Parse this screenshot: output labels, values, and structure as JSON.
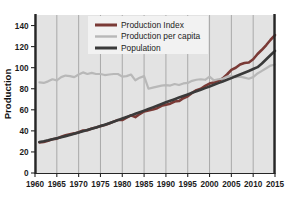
{
  "chart_data": {
    "type": "line",
    "title": "",
    "xlabel": "",
    "ylabel": "Production",
    "xlim": [
      1960,
      2015
    ],
    "ylim": [
      0,
      150
    ],
    "grid": "vertical",
    "legend_position": "top-center",
    "xticks": [
      "1960",
      "1965",
      "1970",
      "1975",
      "1980",
      "1985",
      "1990",
      "1995",
      "2000",
      "2005",
      "2010",
      "2015"
    ],
    "yticks": [
      "0",
      "20",
      "40",
      "60",
      "80",
      "100",
      "120",
      "140"
    ],
    "x": [
      1961,
      1962,
      1963,
      1964,
      1965,
      1966,
      1967,
      1968,
      1969,
      1970,
      1971,
      1972,
      1973,
      1974,
      1975,
      1976,
      1977,
      1978,
      1979,
      1980,
      1981,
      1982,
      1983,
      1984,
      1985,
      1986,
      1987,
      1988,
      1989,
      1990,
      1991,
      1992,
      1993,
      1994,
      1995,
      1996,
      1997,
      1998,
      1999,
      2000,
      2001,
      2002,
      2003,
      2004,
      2005,
      2006,
      2007,
      2008,
      2009,
      2010,
      2011,
      2012,
      2013,
      2014,
      2015
    ],
    "series": [
      {
        "name": "Production Index",
        "color": "#7a3a36",
        "values": [
          29.0,
          29.5,
          30.6,
          32.0,
          32.6,
          34.4,
          35.8,
          36.8,
          37.6,
          38.7,
          40.4,
          40.6,
          42.3,
          43.2,
          44.5,
          45.5,
          47.0,
          48.8,
          50.3,
          50.3,
          52.5,
          54.8,
          53.1,
          56.0,
          58.4,
          59.4,
          60.2,
          61.5,
          63.8,
          64.7,
          65.8,
          67.9,
          68.3,
          71.0,
          72.9,
          76.0,
          78.6,
          80.0,
          82.7,
          84.9,
          86.0,
          87.6,
          89.7,
          93.5,
          97.9,
          99.9,
          103.0,
          104.4,
          104.9,
          108.0,
          113.0,
          117.0,
          121.5,
          126.5,
          131.0
        ]
      },
      {
        "name": "Production per capita",
        "color": "#b8b8b8",
        "values": [
          86.0,
          85.5,
          87.0,
          89.0,
          88.0,
          91.0,
          92.5,
          92.0,
          91.0,
          93.5,
          95.5,
          94.0,
          95.0,
          94.0,
          94.0,
          93.0,
          93.5,
          94.0,
          94.0,
          91.5,
          92.0,
          93.5,
          88.0,
          90.5,
          92.0,
          80.0,
          81.0,
          82.0,
          83.0,
          83.5,
          83.0,
          84.5,
          83.5,
          85.0,
          85.5,
          87.5,
          88.5,
          89.0,
          88.5,
          91.5,
          88.0,
          89.0,
          89.5,
          91.5,
          92.0,
          91.0,
          91.5,
          90.5,
          89.5,
          91.0,
          94.5,
          97.0,
          99.5,
          102.0,
          103.0
        ]
      },
      {
        "name": "Population",
        "color": "#3a3a3a",
        "values": [
          29.5,
          30.2,
          31.0,
          32.0,
          33.0,
          34.0,
          35.0,
          36.0,
          37.2,
          38.4,
          39.6,
          40.8,
          42.0,
          43.3,
          44.6,
          45.9,
          47.3,
          48.7,
          50.2,
          51.7,
          53.2,
          54.7,
          56.2,
          57.7,
          59.2,
          60.7,
          62.3,
          63.9,
          65.5,
          67.1,
          68.6,
          70.1,
          71.6,
          73.1,
          74.6,
          76.1,
          77.6,
          79.1,
          80.6,
          82.1,
          83.7,
          85.3,
          86.9,
          88.5,
          90.1,
          91.8,
          93.5,
          95.2,
          96.9,
          98.7,
          100.5,
          104.0,
          108.0,
          112.0,
          116.0
        ]
      }
    ]
  },
  "legend": {
    "items": [
      {
        "label": "Production Index"
      },
      {
        "label": "Production per capita"
      },
      {
        "label": "Population"
      }
    ]
  },
  "caption": {
    "text": ""
  },
  "colors": {
    "plot_background": "#e3e3e3",
    "gridline": "#9a9a9a",
    "axis_spine": "#262626",
    "legend_background": "#f2f2f2"
  }
}
